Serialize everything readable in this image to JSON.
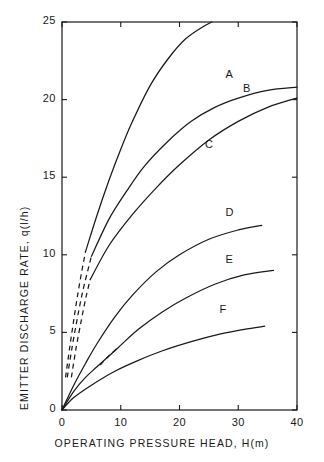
{
  "chart_data": {
    "type": "line",
    "title": "",
    "xlabel": "OPERATING PRESSURE HEAD, H(m)",
    "ylabel": "EMITTER DISCHARGE RATE, q(l/h)",
    "xlim": [
      0,
      40
    ],
    "ylim": [
      0,
      25
    ],
    "xticks": [
      0,
      10,
      20,
      30,
      40
    ],
    "xtick_labels": [
      "0",
      "10",
      "20",
      "30",
      "40"
    ],
    "yticks": [
      0,
      5,
      10,
      15,
      20,
      25
    ],
    "ytick_labels": [
      "0",
      "5",
      "10",
      "15",
      "20",
      "25"
    ],
    "grid": false,
    "legend": "inline-curve-labels",
    "line_color": "#1a1a1a",
    "background": "#ffffff",
    "series": [
      {
        "name": "A",
        "label": "A",
        "label_x": 28.5,
        "label_y": 21.5,
        "dashed_segment": [
          [
            0.6,
            2.1
          ],
          [
            1.3,
            4.0
          ],
          [
            2.0,
            5.8
          ],
          [
            2.7,
            7.5
          ],
          [
            3.4,
            9.0
          ],
          [
            4.0,
            10.2
          ]
        ],
        "solid_segment": [
          [
            4.0,
            10.2
          ],
          [
            6.0,
            12.6
          ],
          [
            8.0,
            14.8
          ],
          [
            10.0,
            16.8
          ],
          [
            12.0,
            18.6
          ],
          [
            15.0,
            20.9
          ],
          [
            18.0,
            22.6
          ],
          [
            21.0,
            23.9
          ],
          [
            24.0,
            24.7
          ],
          [
            25.5,
            25.0
          ]
        ],
        "points": [
          [
            0.6,
            2.1
          ],
          [
            1.3,
            4.0
          ],
          [
            2.0,
            5.8
          ],
          [
            2.7,
            7.5
          ],
          [
            3.4,
            9.0
          ],
          [
            4.0,
            10.2
          ],
          [
            6.0,
            12.6
          ],
          [
            8.0,
            14.8
          ],
          [
            10.0,
            16.8
          ],
          [
            12.0,
            18.6
          ],
          [
            15.0,
            20.9
          ],
          [
            18.0,
            22.6
          ],
          [
            21.0,
            23.9
          ],
          [
            24.0,
            24.7
          ],
          [
            25.5,
            25.0
          ]
        ]
      },
      {
        "name": "B",
        "label": "B",
        "label_x": 31.5,
        "label_y": 20.6,
        "dashed_segment": [
          [
            0.9,
            2.1
          ],
          [
            1.7,
            4.0
          ],
          [
            2.6,
            5.9
          ],
          [
            3.5,
            7.6
          ],
          [
            4.4,
            9.0
          ],
          [
            5.0,
            9.9
          ]
        ],
        "solid_segment": [
          [
            5.0,
            9.9
          ],
          [
            8.0,
            12.3
          ],
          [
            11.0,
            14.1
          ],
          [
            14.0,
            15.7
          ],
          [
            18.0,
            17.3
          ],
          [
            22.0,
            18.6
          ],
          [
            26.0,
            19.5
          ],
          [
            30.0,
            20.1
          ],
          [
            35.0,
            20.6
          ],
          [
            40.0,
            20.8
          ]
        ],
        "points": [
          [
            0.9,
            2.1
          ],
          [
            1.7,
            4.0
          ],
          [
            2.6,
            5.9
          ],
          [
            3.5,
            7.6
          ],
          [
            4.4,
            9.0
          ],
          [
            5.0,
            9.9
          ],
          [
            8.0,
            12.3
          ],
          [
            11.0,
            14.1
          ],
          [
            14.0,
            15.7
          ],
          [
            18.0,
            17.3
          ],
          [
            22.0,
            18.6
          ],
          [
            26.0,
            19.5
          ],
          [
            30.0,
            20.1
          ],
          [
            35.0,
            20.6
          ],
          [
            40.0,
            20.8
          ]
        ]
      },
      {
        "name": "C",
        "label": "C",
        "label_x": 25.0,
        "label_y": 17.0,
        "dashed_segment": [
          [
            1.6,
            2.1
          ],
          [
            2.4,
            4.0
          ],
          [
            3.3,
            5.8
          ],
          [
            4.1,
            7.3
          ],
          [
            4.8,
            8.4
          ]
        ],
        "solid_segment": [
          [
            4.8,
            8.4
          ],
          [
            8.0,
            10.6
          ],
          [
            12.0,
            12.6
          ],
          [
            16.0,
            14.3
          ],
          [
            20.0,
            15.8
          ],
          [
            25.0,
            17.4
          ],
          [
            30.0,
            18.6
          ],
          [
            35.0,
            19.5
          ],
          [
            40.0,
            20.1
          ]
        ],
        "points": [
          [
            1.6,
            2.1
          ],
          [
            2.4,
            4.0
          ],
          [
            3.3,
            5.8
          ],
          [
            4.1,
            7.3
          ],
          [
            4.8,
            8.4
          ],
          [
            8.0,
            10.6
          ],
          [
            12.0,
            12.6
          ],
          [
            16.0,
            14.3
          ],
          [
            20.0,
            15.8
          ],
          [
            25.0,
            17.4
          ],
          [
            30.0,
            18.6
          ],
          [
            35.0,
            19.5
          ],
          [
            40.0,
            20.1
          ]
        ]
      },
      {
        "name": "D",
        "label": "D",
        "label_x": 28.5,
        "label_y": 12.6,
        "dashed_segment": [],
        "solid_segment": [
          [
            0.0,
            0.0
          ],
          [
            2.0,
            1.6
          ],
          [
            4.0,
            3.0
          ],
          [
            6.0,
            4.3
          ],
          [
            9.0,
            6.0
          ],
          [
            12.0,
            7.4
          ],
          [
            16.0,
            8.9
          ],
          [
            20.0,
            10.0
          ],
          [
            25.0,
            11.0
          ],
          [
            30.0,
            11.6
          ],
          [
            34.0,
            11.9
          ]
        ],
        "points": [
          [
            0.0,
            0.0
          ],
          [
            2.0,
            1.6
          ],
          [
            4.0,
            3.0
          ],
          [
            6.0,
            4.3
          ],
          [
            9.0,
            6.0
          ],
          [
            12.0,
            7.4
          ],
          [
            16.0,
            8.9
          ],
          [
            20.0,
            10.0
          ],
          [
            25.0,
            11.0
          ],
          [
            30.0,
            11.6
          ],
          [
            34.0,
            11.9
          ]
        ]
      },
      {
        "name": "E",
        "label": "E",
        "label_x": 28.5,
        "label_y": 9.6,
        "dashed_segment": [
          [
            6.5,
            2.9
          ],
          [
            8.0,
            3.5
          ],
          [
            9.5,
            4.0
          ]
        ],
        "solid_segment": [
          [
            0.0,
            0.0
          ],
          [
            2.0,
            1.2
          ],
          [
            4.0,
            2.1
          ],
          [
            6.0,
            2.8
          ],
          [
            9.5,
            4.0
          ],
          [
            13.0,
            5.2
          ],
          [
            17.0,
            6.3
          ],
          [
            21.0,
            7.2
          ],
          [
            26.0,
            8.1
          ],
          [
            31.0,
            8.7
          ],
          [
            36.0,
            9.0
          ]
        ],
        "points": [
          [
            0.0,
            0.0
          ],
          [
            2.0,
            1.2
          ],
          [
            4.0,
            2.1
          ],
          [
            6.0,
            2.8
          ],
          [
            9.5,
            4.0
          ],
          [
            13.0,
            5.2
          ],
          [
            17.0,
            6.3
          ],
          [
            21.0,
            7.2
          ],
          [
            26.0,
            8.1
          ],
          [
            31.0,
            8.7
          ],
          [
            36.0,
            9.0
          ]
        ]
      },
      {
        "name": "F",
        "label": "F",
        "label_x": 27.5,
        "label_y": 6.4,
        "dashed_segment": [],
        "solid_segment": [
          [
            0.0,
            0.0
          ],
          [
            2.0,
            0.8
          ],
          [
            5.0,
            1.6
          ],
          [
            9.0,
            2.5
          ],
          [
            13.0,
            3.2
          ],
          [
            17.0,
            3.8
          ],
          [
            22.0,
            4.4
          ],
          [
            27.0,
            4.9
          ],
          [
            31.0,
            5.2
          ],
          [
            34.5,
            5.4
          ]
        ],
        "points": [
          [
            0.0,
            0.0
          ],
          [
            2.0,
            0.8
          ],
          [
            5.0,
            1.6
          ],
          [
            9.0,
            2.5
          ],
          [
            13.0,
            3.2
          ],
          [
            17.0,
            3.8
          ],
          [
            22.0,
            4.4
          ],
          [
            27.0,
            4.9
          ],
          [
            31.0,
            5.2
          ],
          [
            34.5,
            5.4
          ]
        ]
      }
    ]
  },
  "figure": {
    "plot_left_px": 62,
    "plot_right_px": 297,
    "plot_top_px": 22,
    "plot_bottom_px": 410
  }
}
